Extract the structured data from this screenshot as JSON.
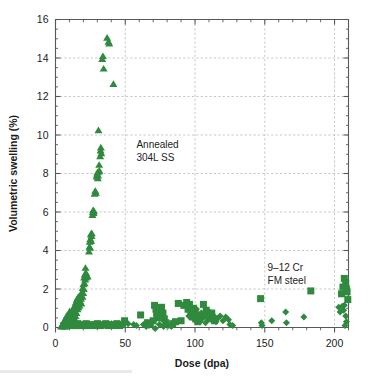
{
  "figure": {
    "background_color": "#ffffff",
    "marker_color": "#2f8a3e",
    "axis_color": "#58585a",
    "grid_color": "#b9b9bb",
    "annotations": [
      {
        "name": "annealed-304l-ss",
        "line1": "Annealed",
        "line2": "304L SS",
        "x": 58,
        "y": 9.3
      },
      {
        "name": "9-12-cr-fm-steel",
        "line1": "9–12 Cr",
        "line2": "FM steel",
        "x": 152,
        "y": 2.95
      }
    ]
  },
  "chart_data": {
    "type": "scatter",
    "title": "",
    "xlabel": "Dose (dpa)",
    "ylabel": "Volumetric swelling (%)",
    "xlim": [
      0,
      210
    ],
    "ylim": [
      0,
      16
    ],
    "xticks": [
      0,
      50,
      100,
      150,
      200
    ],
    "yticks": [
      0,
      2,
      4,
      6,
      8,
      10,
      12,
      14,
      16
    ],
    "xtick_labels": [
      "0",
      "50",
      "100",
      "150",
      "200"
    ],
    "ytick_labels": [
      "0",
      "2",
      "4",
      "6",
      "8",
      "10",
      "12",
      "14",
      "16"
    ],
    "x_minor_interval": 10,
    "y_minor_interval": 0.5,
    "grid": true,
    "grid_style": "dashed",
    "legend": "none",
    "series": [
      {
        "name": "Annealed 304L SS",
        "marker": "triangle",
        "color": "#2f8a3e",
        "points": [
          [
            4.0,
            0.05
          ],
          [
            4.5,
            0.1
          ],
          [
            5.0,
            0.15
          ],
          [
            5.5,
            0.05
          ],
          [
            6.0,
            0.2
          ],
          [
            6.2,
            0.35
          ],
          [
            6.5,
            0.1
          ],
          [
            7.0,
            0.4
          ],
          [
            7.2,
            0.05
          ],
          [
            7.5,
            0.5
          ],
          [
            7.8,
            0.2
          ],
          [
            8.0,
            0.6
          ],
          [
            8.2,
            0.3
          ],
          [
            8.5,
            0.15
          ],
          [
            8.8,
            0.45
          ],
          [
            9.0,
            0.55
          ],
          [
            9.3,
            0.25
          ],
          [
            9.5,
            0.7
          ],
          [
            9.8,
            0.35
          ],
          [
            10.0,
            0.5
          ],
          [
            10.2,
            0.85
          ],
          [
            10.5,
            0.4
          ],
          [
            10.8,
            0.2
          ],
          [
            11.0,
            0.6
          ],
          [
            11.3,
            0.75
          ],
          [
            11.5,
            0.3
          ],
          [
            11.8,
            0.5
          ],
          [
            12.0,
            0.9
          ],
          [
            12.3,
            0.65
          ],
          [
            12.5,
            0.4
          ],
          [
            13.0,
            1.0
          ],
          [
            13.2,
            0.7
          ],
          [
            13.5,
            0.5
          ],
          [
            13.8,
            1.15
          ],
          [
            14.0,
            0.85
          ],
          [
            14.3,
            0.6
          ],
          [
            14.5,
            1.3
          ],
          [
            14.8,
            1.0
          ],
          [
            15.0,
            0.75
          ],
          [
            15.3,
            1.45
          ],
          [
            15.5,
            1.2
          ],
          [
            15.8,
            0.95
          ],
          [
            16.0,
            1.55
          ],
          [
            16.3,
            1.3
          ],
          [
            16.5,
            1.05
          ],
          [
            16.8,
            1.6
          ],
          [
            17.0,
            1.4
          ],
          [
            17.2,
            1.15
          ],
          [
            17.5,
            1.55
          ],
          [
            17.8,
            1.35
          ],
          [
            18.0,
            1.7
          ],
          [
            18.3,
            1.5
          ],
          [
            18.5,
            1.25
          ],
          [
            18.8,
            1.65
          ],
          [
            19.0,
            1.85
          ],
          [
            19.3,
            1.6
          ],
          [
            19.5,
            2.05
          ],
          [
            19.8,
            1.8
          ],
          [
            20.0,
            2.25
          ],
          [
            20.3,
            2.0
          ],
          [
            20.5,
            2.6
          ],
          [
            20.8,
            2.3
          ],
          [
            21.0,
            2.75
          ],
          [
            21.3,
            2.5
          ],
          [
            21.5,
            3.1
          ],
          [
            21.8,
            2.85
          ],
          [
            22.0,
            2.6
          ],
          [
            22.5,
            2.7
          ],
          [
            23.0,
            2.65
          ],
          [
            24.0,
            3.95
          ],
          [
            24.3,
            4.2
          ],
          [
            24.5,
            4.45
          ],
          [
            24.8,
            4.15
          ],
          [
            25.0,
            4.6
          ],
          [
            25.3,
            4.85
          ],
          [
            25.5,
            4.5
          ],
          [
            25.8,
            4.75
          ],
          [
            26.0,
            4.9
          ],
          [
            26.5,
            5.85
          ],
          [
            26.8,
            6.0
          ],
          [
            27.0,
            6.1
          ],
          [
            27.3,
            5.95
          ],
          [
            27.5,
            6.05
          ],
          [
            28.0,
            6.95
          ],
          [
            28.5,
            7.1
          ],
          [
            29.0,
            7.0
          ],
          [
            29.5,
            7.85
          ],
          [
            29.8,
            7.95
          ],
          [
            30.0,
            8.05
          ],
          [
            30.3,
            7.75
          ],
          [
            30.5,
            7.9
          ],
          [
            31.0,
            8.1
          ],
          [
            31.3,
            8.45
          ],
          [
            31.5,
            8.15
          ],
          [
            32.0,
            8.9
          ],
          [
            32.3,
            9.2
          ],
          [
            32.5,
            9.35
          ],
          [
            32.8,
            9.05
          ],
          [
            30.8,
            10.25
          ],
          [
            33.5,
            13.95
          ],
          [
            34.0,
            14.1
          ],
          [
            34.5,
            13.45
          ],
          [
            37.0,
            15.05
          ],
          [
            38.0,
            14.85
          ],
          [
            38.5,
            14.75
          ],
          [
            41.5,
            12.65
          ],
          [
            23.5,
            0.1
          ],
          [
            26.0,
            0.15
          ],
          [
            29.0,
            0.1
          ],
          [
            31.0,
            0.2
          ],
          [
            34.0,
            0.15
          ],
          [
            37.0,
            0.1
          ],
          [
            40.0,
            0.2
          ],
          [
            43.0,
            0.15
          ]
        ]
      },
      {
        "name": "9–12 Cr FM steel (squares)",
        "marker": "square",
        "color": "#2f8a3e",
        "points": [
          [
            6.0,
            0.1
          ],
          [
            7.5,
            0.15
          ],
          [
            9.0,
            0.1
          ],
          [
            10.5,
            0.2
          ],
          [
            12.0,
            0.1
          ],
          [
            13.0,
            0.15
          ],
          [
            14.5,
            0.1
          ],
          [
            16.0,
            0.2
          ],
          [
            17.5,
            0.1
          ],
          [
            19.0,
            0.15
          ],
          [
            20.5,
            0.1
          ],
          [
            22.0,
            0.2
          ],
          [
            24.0,
            0.1
          ],
          [
            26.0,
            0.15
          ],
          [
            28.0,
            0.1
          ],
          [
            30.0,
            0.2
          ],
          [
            32.0,
            0.1
          ],
          [
            34.0,
            0.15
          ],
          [
            36.0,
            0.2
          ],
          [
            38.0,
            0.1
          ],
          [
            40.0,
            0.15
          ],
          [
            42.0,
            0.1
          ],
          [
            44.0,
            0.2
          ],
          [
            46.0,
            0.1
          ],
          [
            48.0,
            0.15
          ],
          [
            49.5,
            0.35
          ],
          [
            61.0,
            0.65
          ],
          [
            66.0,
            0.25
          ],
          [
            68.0,
            0.2
          ],
          [
            70.0,
            0.35
          ],
          [
            71.0,
            1.15
          ],
          [
            72.0,
            0.95
          ],
          [
            72.5,
            0.7
          ],
          [
            73.0,
            1.0
          ],
          [
            73.5,
            0.5
          ],
          [
            74.0,
            0.8
          ],
          [
            75.0,
            0.6
          ],
          [
            76.0,
            1.05
          ],
          [
            77.0,
            0.75
          ],
          [
            78.0,
            0.45
          ],
          [
            79.0,
            0.25
          ],
          [
            84.0,
            0.2
          ],
          [
            86.0,
            0.3
          ],
          [
            88.0,
            1.25
          ],
          [
            90.0,
            0.35
          ],
          [
            92.0,
            1.15
          ],
          [
            94.0,
            1.3
          ],
          [
            95.0,
            0.95
          ],
          [
            96.0,
            1.2
          ],
          [
            97.0,
            0.75
          ],
          [
            98.0,
            0.55
          ],
          [
            99.0,
            1.0
          ],
          [
            100.0,
            0.85
          ],
          [
            100.5,
            0.45
          ],
          [
            101.0,
            0.65
          ],
          [
            102.0,
            0.3
          ],
          [
            103.0,
            0.5
          ],
          [
            106.0,
            1.2
          ],
          [
            107.0,
            0.6
          ],
          [
            108.0,
            0.9
          ],
          [
            110.0,
            0.45
          ],
          [
            112.0,
            0.75
          ],
          [
            114.0,
            0.35
          ],
          [
            147.0,
            1.5
          ],
          [
            183.0,
            1.9
          ],
          [
            205.0,
            1.75
          ],
          [
            206.0,
            2.1
          ],
          [
            207.0,
            2.55
          ],
          [
            208.0,
            2.3
          ],
          [
            208.5,
            2.0
          ],
          [
            209.0,
            1.85
          ],
          [
            209.5,
            1.45
          ]
        ]
      },
      {
        "name": "9–12 Cr FM steel (diamonds)",
        "marker": "diamond",
        "color": "#2f8a3e",
        "points": [
          [
            28.0,
            0.1
          ],
          [
            31.0,
            0.15
          ],
          [
            34.5,
            0.1
          ],
          [
            37.5,
            0.15
          ],
          [
            52.0,
            0.2
          ],
          [
            56.0,
            0.15
          ],
          [
            58.0,
            0.1
          ],
          [
            63.0,
            0.15
          ],
          [
            65.0,
            0.05
          ],
          [
            67.0,
            0.1
          ],
          [
            71.5,
            -0.05
          ],
          [
            74.5,
            0.15
          ],
          [
            77.5,
            0.05
          ],
          [
            81.0,
            0.1
          ],
          [
            83.0,
            0.05
          ],
          [
            95.5,
            0.6
          ],
          [
            97.5,
            0.85
          ],
          [
            99.5,
            0.4
          ],
          [
            101.0,
            0.95
          ],
          [
            102.0,
            0.6
          ],
          [
            103.5,
            0.3
          ],
          [
            104.5,
            0.75
          ],
          [
            105.5,
            0.5
          ],
          [
            107.5,
            0.25
          ],
          [
            109.0,
            0.55
          ],
          [
            110.5,
            0.8
          ],
          [
            112.0,
            0.4
          ],
          [
            113.5,
            0.6
          ],
          [
            115.0,
            0.3
          ],
          [
            116.5,
            0.5
          ],
          [
            118.0,
            0.6
          ],
          [
            120.0,
            0.35
          ],
          [
            122.0,
            0.55
          ],
          [
            124.0,
            0.4
          ],
          [
            125.0,
            0.15
          ],
          [
            127.0,
            0.1
          ],
          [
            147.5,
            0.25
          ],
          [
            148.0,
            0.1
          ],
          [
            155.0,
            0.35
          ],
          [
            165.0,
            0.8
          ],
          [
            165.5,
            0.25
          ],
          [
            178.0,
            0.55
          ],
          [
            203.0,
            1.05
          ],
          [
            204.0,
            0.8
          ],
          [
            205.5,
            1.1
          ],
          [
            206.5,
            0.9
          ],
          [
            207.0,
            1.15
          ],
          [
            208.0,
            0.6
          ],
          [
            208.5,
            0.3
          ],
          [
            207.5,
            0.1
          ]
        ]
      }
    ]
  }
}
